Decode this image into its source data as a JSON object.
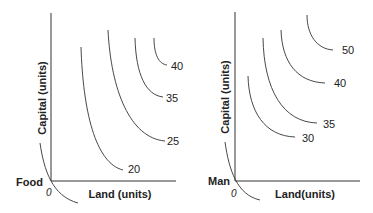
{
  "panels": [
    {
      "id": "food",
      "y_axis_label": "Capital (units)",
      "x_axis_label": "Land (units)",
      "origin_label": "0",
      "product_label": "Food",
      "isoquants": [
        {
          "label": "20",
          "path": "M81,47 C83,110 95,163 123,170",
          "lx": 128,
          "ly": 173
        },
        {
          "label": "25",
          "path": "M108,30 C111,90 130,138 165,141",
          "lx": 167,
          "ly": 145
        },
        {
          "label": "35",
          "path": "M135,38 C136,75 146,95 163,97",
          "lx": 166,
          "ly": 102
        },
        {
          "label": "40",
          "path": "M154,38 C154,55 159,64 167,65",
          "lx": 171,
          "ly": 70
        }
      ],
      "product_curve": "M40,143 C44,170 52,196 78,203"
    },
    {
      "id": "man",
      "y_axis_label": "Capital (units)",
      "x_axis_label": "Land(units)",
      "origin_label": "0",
      "product_label": "Man",
      "isoquants": [
        {
          "label": "30",
          "path": "M248,76 C249,112 265,136 295,137",
          "lx": 302,
          "ly": 142
        },
        {
          "label": "35",
          "path": "M263,38 C264,90 283,122 317,123",
          "lx": 323,
          "ly": 128
        },
        {
          "label": "40",
          "path": "M281,30 C282,62 297,82 325,83",
          "lx": 334,
          "ly": 87
        },
        {
          "label": "50",
          "path": "M307,15 C307,35 317,49 333,50",
          "lx": 342,
          "ly": 54
        }
      ],
      "product_curve": "M225,142 C229,170 237,195 260,200"
    }
  ]
}
